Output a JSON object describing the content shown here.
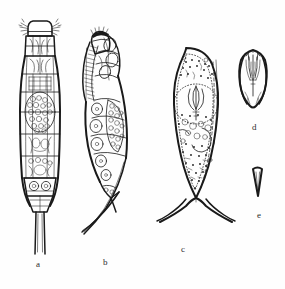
{
  "plate": {
    "kind": "scientific-illustration-plate",
    "medium": "ink line drawing",
    "background_color": "#fefefe",
    "ink_color": "#1a1a1a",
    "width": 285,
    "height": 289,
    "subject": "microscopic invertebrate specimens, five figures",
    "figures": [
      {
        "id": "a",
        "label": "a",
        "label_x": 36,
        "label_y": 260,
        "view": "dorsal whole body",
        "description": "elongate segmented body with head shield, paired anterior setae, dense granular internal contents, tapering to a pair of long straight caudal spines",
        "bbox": [
          14,
          18,
          50,
          240
        ]
      },
      {
        "id": "b",
        "label": "b",
        "label_x": 103,
        "label_y": 258,
        "view": "lateral whole body",
        "description": "curved lateral aspect with densely hatched anterior comb, vesicular internal cells and long curving caudal setae",
        "bbox": [
          78,
          28,
          60,
          210
        ]
      },
      {
        "id": "c",
        "label": "c",
        "label_x": 181,
        "label_y": 245,
        "view": "outline with stippled contents",
        "description": "broad ovate body, dotted inner membrane outline, central trilobed floral organ, stippled granules, terminating in two long divergent curved appendages",
        "bbox": [
          150,
          48,
          72,
          175
        ]
      },
      {
        "id": "d",
        "label": "d",
        "label_x": 252,
        "label_y": 123,
        "view": "detail of organ",
        "description": "small flask or bud shaped structure with internal radiating rods",
        "bbox": [
          236,
          48,
          34,
          62
        ]
      },
      {
        "id": "e",
        "label": "e",
        "label_x": 257,
        "label_y": 211,
        "view": "detail of spine",
        "description": "small narrow elongate triangular spine, solid outline",
        "bbox": [
          252,
          168,
          12,
          32
        ]
      }
    ]
  }
}
